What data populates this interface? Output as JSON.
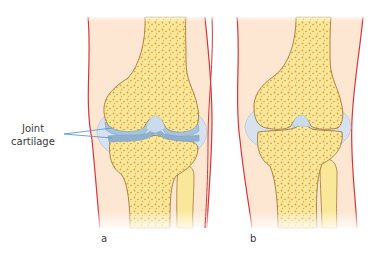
{
  "figure": {
    "annotation": {
      "line1": "Joint",
      "line2": "cartilage"
    },
    "panels": [
      {
        "label": "a",
        "description": "Knee joint with intact joint cartilage"
      },
      {
        "label": "b",
        "description": "Knee joint with worn joint cartilage"
      }
    ],
    "colors": {
      "skin": "#fde6d2",
      "skin_outline": "#d8353a",
      "bone": "#fbe79a",
      "bone_outline": "#a07a35",
      "spongy_bone": "#e0a03c",
      "cartilage": "#a6c4dd",
      "cartilage_dark": "#7d9fbf",
      "capsule": "#d7e2ee",
      "pointer": "#5a9bd6"
    }
  }
}
